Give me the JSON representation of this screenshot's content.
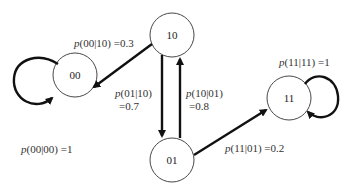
{
  "diagram": {
    "type": "state-transition",
    "nodes": [
      {
        "id": "10",
        "label": "10",
        "cx": 172,
        "cy": 35
      },
      {
        "id": "00",
        "label": "00",
        "cx": 75,
        "cy": 75
      },
      {
        "id": "01",
        "label": "01",
        "cx": 172,
        "cy": 160
      },
      {
        "id": "11",
        "label": "11",
        "cx": 289,
        "cy": 98
      }
    ],
    "edges": [
      {
        "from": "10",
        "to": "00",
        "label_p": "p",
        "label_rest": "(00|10) =0.3"
      },
      {
        "from": "10",
        "to": "01",
        "label_p": "p",
        "label_rest": "(01|10)",
        "label_line2": "=0.7"
      },
      {
        "from": "01",
        "to": "10",
        "label_p": "p",
        "label_rest": "(10|01)",
        "label_line2": "=0.8"
      },
      {
        "from": "01",
        "to": "11",
        "label_p": "p",
        "label_rest": "(11|01) =0.2"
      },
      {
        "from": "00",
        "to": "00",
        "label_p": "p",
        "label_rest": "(00|00) =1"
      },
      {
        "from": "11",
        "to": "11",
        "label_p": "p",
        "label_rest": "(11|11) =1"
      }
    ]
  }
}
